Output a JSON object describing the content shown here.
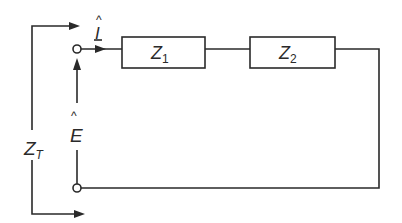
{
  "diagram": {
    "type": "series circuit",
    "components": [
      {
        "id": "Z1",
        "symbol": "Z",
        "subscript": "1"
      },
      {
        "id": "Z2",
        "symbol": "Z",
        "subscript": "2"
      }
    ],
    "labels": {
      "current": {
        "symbol": "I",
        "hat": "^"
      },
      "voltage": {
        "symbol": "E",
        "hat": "^"
      },
      "total_impedance": {
        "symbol": "Z",
        "subscript": "T"
      }
    },
    "colors": {
      "line": "#2a2a2a",
      "background": "#ffffff"
    }
  }
}
